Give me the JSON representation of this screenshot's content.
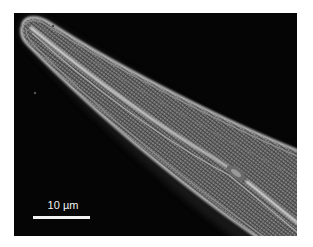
{
  "figure": {
    "background_color": "#050505",
    "frame_border_color": "#ffffff"
  },
  "scale_bar": {
    "label": "10 µm",
    "color": "#f2f2f2"
  }
}
